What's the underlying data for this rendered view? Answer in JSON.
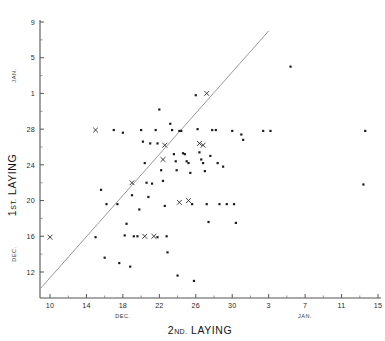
{
  "chart_data": {
    "type": "scatter",
    "title": "",
    "xlabel": "2ND. LAYING",
    "ylabel": "1ST. LAYING",
    "x_month_labels": [
      {
        "text": "DEC.",
        "at": 18
      },
      {
        "text": "JAN.",
        "at": 38
      }
    ],
    "y_month_labels": [
      {
        "text": "DEC.",
        "at": 14
      },
      {
        "text": "JAN.",
        "at": 34
      }
    ],
    "grid": false,
    "legend": null,
    "xlim": [
      8,
      46
    ],
    "ylim": [
      10,
      40
    ],
    "x_ticks": [
      {
        "value": 10,
        "label": "10"
      },
      {
        "value": 14,
        "label": "14"
      },
      {
        "value": 18,
        "label": "18"
      },
      {
        "value": 22,
        "label": "22"
      },
      {
        "value": 26,
        "label": "26"
      },
      {
        "value": 30,
        "label": "30"
      },
      {
        "value": 34,
        "label": "3"
      },
      {
        "value": 38,
        "label": "7"
      },
      {
        "value": 42,
        "label": "11"
      },
      {
        "value": 46,
        "label": "15"
      }
    ],
    "y_ticks": [
      {
        "value": 12,
        "label": "12"
      },
      {
        "value": 16,
        "label": "16"
      },
      {
        "value": 20,
        "label": "20"
      },
      {
        "value": 24,
        "label": "24"
      },
      {
        "value": 28,
        "label": "28"
      },
      {
        "value": 32,
        "label": "1"
      },
      {
        "value": 36,
        "label": "5"
      },
      {
        "value": 40,
        "label": "9"
      }
    ],
    "reference_line": {
      "description": "line of equality",
      "x0": 9.0,
      "y0": 10.2,
      "x1": 34.0,
      "y1": 39.0,
      "color": "#8d8d8d"
    },
    "series": [
      {
        "name": "observations",
        "marker": "dot",
        "color": "#1c1c1c",
        "points": [
          [
            15.0,
            15.9
          ],
          [
            15.6,
            21.2
          ],
          [
            16.0,
            13.6
          ],
          [
            16.2,
            19.6
          ],
          [
            17.0,
            27.9
          ],
          [
            17.4,
            19.6
          ],
          [
            17.6,
            13.0
          ],
          [
            18.0,
            27.6
          ],
          [
            18.2,
            16.1
          ],
          [
            18.4,
            17.4
          ],
          [
            18.8,
            12.6
          ],
          [
            19.0,
            20.6
          ],
          [
            19.2,
            16.0
          ],
          [
            19.6,
            16.0
          ],
          [
            19.8,
            19.0
          ],
          [
            20.0,
            27.9
          ],
          [
            20.2,
            26.6
          ],
          [
            20.4,
            24.2
          ],
          [
            20.6,
            22.0
          ],
          [
            20.8,
            20.4
          ],
          [
            21.0,
            26.4
          ],
          [
            21.2,
            21.9
          ],
          [
            21.6,
            27.9
          ],
          [
            21.8,
            26.4
          ],
          [
            21.8,
            15.9
          ],
          [
            22.0,
            30.2
          ],
          [
            22.2,
            23.4
          ],
          [
            22.4,
            22.2
          ],
          [
            22.6,
            19.4
          ],
          [
            22.8,
            16.0
          ],
          [
            22.9,
            14.2
          ],
          [
            23.2,
            28.6
          ],
          [
            23.4,
            27.9
          ],
          [
            23.6,
            25.2
          ],
          [
            23.8,
            24.4
          ],
          [
            23.9,
            23.4
          ],
          [
            24.0,
            11.6
          ],
          [
            24.2,
            27.8
          ],
          [
            24.4,
            27.8
          ],
          [
            24.6,
            25.3
          ],
          [
            24.8,
            25.2
          ],
          [
            25.0,
            24.4
          ],
          [
            25.2,
            24.2
          ],
          [
            25.4,
            23.1
          ],
          [
            25.6,
            19.6
          ],
          [
            25.8,
            11.0
          ],
          [
            26.0,
            31.8
          ],
          [
            26.2,
            28.0
          ],
          [
            26.4,
            25.4
          ],
          [
            26.6,
            24.6
          ],
          [
            26.8,
            24.2
          ],
          [
            27.0,
            23.3
          ],
          [
            27.2,
            19.6
          ],
          [
            27.4,
            17.6
          ],
          [
            27.6,
            25.0
          ],
          [
            27.8,
            27.9
          ],
          [
            28.2,
            27.9
          ],
          [
            28.4,
            24.2
          ],
          [
            28.6,
            19.6
          ],
          [
            29.0,
            23.8
          ],
          [
            29.4,
            19.6
          ],
          [
            30.0,
            27.8
          ],
          [
            30.2,
            19.6
          ],
          [
            30.4,
            17.5
          ],
          [
            31.0,
            27.4
          ],
          [
            31.2,
            26.8
          ],
          [
            33.4,
            27.8
          ],
          [
            34.2,
            27.8
          ],
          [
            36.4,
            35.0
          ],
          [
            44.6,
            27.8
          ],
          [
            44.4,
            21.8
          ]
        ]
      },
      {
        "name": "marked-observations",
        "marker": "x",
        "color": "#1c1c1c",
        "points": [
          [
            10.0,
            15.9
          ],
          [
            15.0,
            27.9
          ],
          [
            19.0,
            22.0
          ],
          [
            20.4,
            16.0
          ],
          [
            21.4,
            16.0
          ],
          [
            22.4,
            24.6
          ],
          [
            22.6,
            26.2
          ],
          [
            24.2,
            19.8
          ],
          [
            25.2,
            20.0
          ],
          [
            26.4,
            26.4
          ],
          [
            26.8,
            26.2
          ],
          [
            27.2,
            32.0
          ]
        ]
      }
    ]
  },
  "figure": {
    "background": "#ffffff",
    "axis_color": "#555555"
  }
}
